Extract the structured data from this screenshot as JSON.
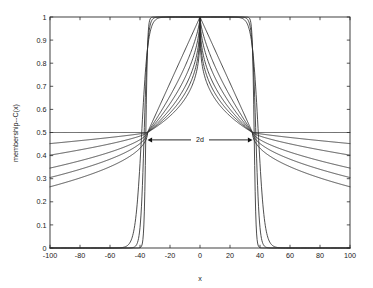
{
  "figure": {
    "background_color": "#ffffff",
    "axes_color": "#2b2b2b",
    "curve_color": "#2e2e2e",
    "annotation_color": "#111111"
  },
  "chart_data": {
    "type": "line",
    "title": "",
    "xlabel": "x",
    "ylabel": "membership--C(x)",
    "xlim": [
      -100,
      100
    ],
    "ylim": [
      0,
      1
    ],
    "grid": false,
    "legend": null,
    "xticks": [
      -100,
      -80,
      -60,
      -40,
      -20,
      0,
      20,
      40,
      60,
      80,
      100
    ],
    "xtick_labels": [
      "-100",
      "-80",
      "-60",
      "-40",
      "-20",
      "0",
      "20",
      "40",
      "60",
      "80",
      "100"
    ],
    "yticks": [
      0,
      0.1,
      0.2,
      0.3,
      0.4,
      0.5,
      0.6,
      0.7,
      0.8,
      0.9,
      1
    ],
    "ytick_labels": [
      "0",
      "0.1",
      "0.2",
      "0.3",
      "0.4",
      "0.5",
      "0.6",
      "0.7",
      "0.8",
      "0.9",
      "1"
    ],
    "crossover_x": [
      -35,
      35
    ],
    "crossover_y": 0.5,
    "annotations": [
      {
        "name": "2d-span",
        "text": "2d",
        "x_start": -35,
        "x_end": 35,
        "y": 0.468,
        "style": "double-headed-arrow"
      }
    ],
    "series": [
      {
        "name": "k=1 (flattest)",
        "edge_value_at_minus_100": 0.5,
        "edge_value_at_plus_100": 0.5,
        "steepness": 0.0,
        "outer_floor": 0.5,
        "peak": 1.0
      },
      {
        "name": "k=2",
        "edge_value_at_minus_100": 0.452,
        "edge_value_at_plus_100": 0.452,
        "steepness": 0.35,
        "outer_floor": 0.452,
        "peak": 1.0
      },
      {
        "name": "k=3",
        "edge_value_at_minus_100": 0.402,
        "edge_value_at_plus_100": 0.402,
        "steepness": 0.7,
        "outer_floor": 0.402,
        "peak": 1.0
      },
      {
        "name": "k=4",
        "edge_value_at_minus_100": 0.346,
        "edge_value_at_plus_100": 0.346,
        "steepness": 1.1,
        "outer_floor": 0.346,
        "peak": 1.0
      },
      {
        "name": "k=5",
        "edge_value_at_minus_100": 0.305,
        "edge_value_at_plus_100": 0.305,
        "steepness": 1.5,
        "outer_floor": 0.305,
        "peak": 1.0
      },
      {
        "name": "k=6 (steepest fan)",
        "edge_value_at_minus_100": 0.265,
        "edge_value_at_plus_100": 0.265,
        "steepness": 1.95,
        "outer_floor": 0.265,
        "peak": 1.0
      },
      {
        "name": "crisp-step-1",
        "type": "step",
        "transition_width": 2.0,
        "edge_value_at_minus_100": 0.0,
        "peak": 1.0
      },
      {
        "name": "crisp-step-2",
        "type": "step",
        "transition_width": 4.0,
        "edge_value_at_minus_100": 0.0,
        "peak": 1.0
      },
      {
        "name": "crisp-step-3",
        "type": "step",
        "transition_width": 7.0,
        "edge_value_at_minus_100": 0.0,
        "peak": 1.0
      }
    ]
  }
}
